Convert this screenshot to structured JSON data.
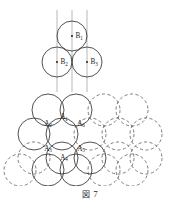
{
  "figure": {
    "caption_glyph": "図",
    "caption_number": "7",
    "stroke_color": "#333333",
    "dashed_color": "#555555",
    "line_color": "#999999",
    "dot_color": "#111111"
  },
  "top_diagram": {
    "name": "three-sphere-B-layer",
    "circle_radius": 15.0,
    "guide_lines": [
      {
        "x": 57.0,
        "y1": 10.0,
        "y2": 92.0
      },
      {
        "x": 72.0,
        "y1": 10.0,
        "y2": 92.0
      },
      {
        "x": 87.0,
        "y1": 10.0,
        "y2": 92.0
      }
    ],
    "circles": [
      {
        "id": "B1",
        "cx": 72.0,
        "cy": 36.0,
        "r": 15.0,
        "style": "solid",
        "label": "B",
        "sub": "1",
        "label_dx": 3.5,
        "label_dy": 2.0
      },
      {
        "id": "B2",
        "cx": 57.0,
        "cy": 62.0,
        "r": 15.0,
        "style": "solid",
        "label": "B",
        "sub": "2",
        "label_dx": 3.5,
        "label_dy": 2.0
      },
      {
        "id": "B3",
        "cx": 87.0,
        "cy": 62.0,
        "r": 15.0,
        "style": "solid",
        "label": "B",
        "sub": "3",
        "label_dx": 3.5,
        "label_dy": 2.0
      }
    ]
  },
  "bottom_diagram": {
    "name": "hexagonal-close-packed-A-layer",
    "circle_radius": 16.0,
    "circles": [
      {
        "id": "r1c1",
        "cx": 48.0,
        "cy": 110.0,
        "r": 16.0,
        "style": "solid"
      },
      {
        "id": "r1c2",
        "cx": 76.0,
        "cy": 110.0,
        "r": 16.0,
        "style": "solid"
      },
      {
        "id": "r1c3",
        "cx": 104.0,
        "cy": 110.0,
        "r": 16.0,
        "style": "dashed"
      },
      {
        "id": "r1c4",
        "cx": 132.0,
        "cy": 110.0,
        "r": 16.0,
        "style": "dashed"
      },
      {
        "id": "r2c1",
        "cx": 34.0,
        "cy": 134.0,
        "r": 16.0,
        "style": "solid"
      },
      {
        "id": "r2c2",
        "cx": 62.0,
        "cy": 134.0,
        "r": 16.0,
        "style": "solid"
      },
      {
        "id": "r2c3",
        "cx": 90.0,
        "cy": 134.0,
        "r": 16.0,
        "style": "dashed"
      },
      {
        "id": "r2c4",
        "cx": 118.0,
        "cy": 134.0,
        "r": 16.0,
        "style": "dashed"
      },
      {
        "id": "r2c5",
        "cx": 146.0,
        "cy": 134.0,
        "r": 16.0,
        "style": "dashed"
      },
      {
        "id": "r3c1",
        "cx": 34.0,
        "cy": 158.0,
        "r": 16.0,
        "style": "dashed"
      },
      {
        "id": "r3c2",
        "cx": 62.0,
        "cy": 158.0,
        "r": 16.0,
        "style": "solid"
      },
      {
        "id": "r3c3",
        "cx": 90.0,
        "cy": 158.0,
        "r": 16.0,
        "style": "solid"
      },
      {
        "id": "r3c4",
        "cx": 118.0,
        "cy": 158.0,
        "r": 16.0,
        "style": "dashed"
      },
      {
        "id": "r3c5",
        "cx": 146.0,
        "cy": 158.0,
        "r": 16.0,
        "style": "dashed"
      },
      {
        "id": "r4c1",
        "cx": 20.0,
        "cy": 170.0,
        "r": 16.0,
        "style": "dashed"
      },
      {
        "id": "r4c2",
        "cx": 48.0,
        "cy": 170.0,
        "r": 16.0,
        "style": "solid"
      },
      {
        "id": "r4c3",
        "cx": 76.0,
        "cy": 170.0,
        "r": 16.0,
        "style": "solid"
      },
      {
        "id": "r4c4",
        "cx": 104.0,
        "cy": 170.0,
        "r": 16.0,
        "style": "dashed"
      },
      {
        "id": "r4c5",
        "cx": 132.0,
        "cy": 170.0,
        "r": 16.0,
        "style": "dashed"
      }
    ],
    "labels": [
      {
        "id": "A1",
        "letter": "A",
        "sub": "1",
        "x": 64.0,
        "y": 119.0
      },
      {
        "id": "A2",
        "letter": "A",
        "sub": "2",
        "x": 48.0,
        "y": 125.5
      },
      {
        "id": "A6",
        "letter": "A",
        "sub": "6",
        "x": 81.0,
        "y": 125.5
      },
      {
        "id": "A3",
        "letter": "A",
        "sub": "3",
        "x": 48.0,
        "y": 150.5
      },
      {
        "id": "A5",
        "letter": "A",
        "sub": "5",
        "x": 81.0,
        "y": 150.5
      },
      {
        "id": "A4",
        "letter": "A",
        "sub": "4",
        "x": 64.0,
        "y": 159.5
      }
    ]
  }
}
